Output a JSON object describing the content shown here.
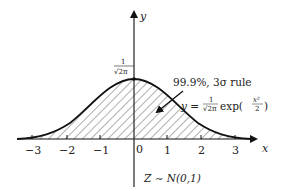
{
  "diagram": {
    "type": "normal-distribution-curve",
    "axes": {
      "x_label": "x",
      "y_label": "y",
      "x_ticks": [
        "−3",
        "−2",
        "−1",
        "0",
        "1",
        "2",
        "3"
      ]
    },
    "peak_label": {
      "numerator": "1",
      "denominator": "√2π"
    },
    "annotation": "99.9%, 3σ rule",
    "formula": {
      "lhs": "y =",
      "frac_num": "1",
      "frac_den": "√2π",
      "func": "exp(",
      "exp_num": "x²",
      "exp_den": "2",
      "close": ")"
    },
    "caption": "Z ∼ N(0,1)",
    "colors": {
      "stroke": "#111111",
      "hatch": "#333333",
      "background": "#ffffff"
    }
  }
}
